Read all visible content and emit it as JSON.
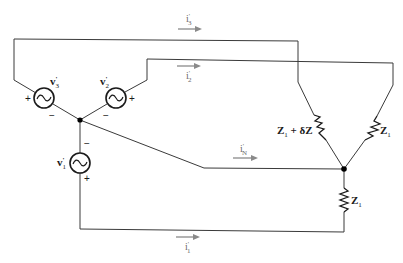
{
  "diagram": {
    "type": "three-phase wye-wye circuit with unbalanced load",
    "sources": [
      {
        "id": "v1",
        "label": "v",
        "sup": "'",
        "sub": "1",
        "plus_side": "bottom",
        "minus_side": "top"
      },
      {
        "id": "v2",
        "label": "v",
        "sup": "'",
        "sub": "2",
        "plus_side": "right",
        "minus_side": "left"
      },
      {
        "id": "v3",
        "label": "v",
        "sup": "'",
        "sub": "3",
        "plus_side": "left",
        "minus_side": "right"
      }
    ],
    "currents": [
      {
        "id": "i3",
        "label": "i",
        "sup": "'",
        "sub": "3"
      },
      {
        "id": "i2",
        "label": "i",
        "sup": "'",
        "sub": "2"
      },
      {
        "id": "iN",
        "label": "i",
        "sup": "'",
        "sub": "N"
      },
      {
        "id": "i1",
        "label": "i",
        "sup": "'",
        "sub": "1"
      }
    ],
    "impedances": [
      {
        "id": "z_left",
        "label": "Z",
        "sub": "1",
        "suffix": " + δZ"
      },
      {
        "id": "z_right",
        "label": "Z",
        "sub": "1",
        "suffix": ""
      },
      {
        "id": "z_bottom",
        "label": "Z",
        "sub": "1",
        "suffix": ""
      }
    ],
    "signs": {
      "plus": "+",
      "minus": "−"
    },
    "colors": {
      "wire": "#3a3a3a",
      "arrow": "#8a8a8a",
      "text": "#1a1a1a"
    }
  }
}
